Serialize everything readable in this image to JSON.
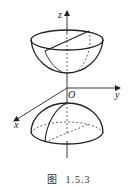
{
  "figure": {
    "axes": {
      "z_label": "z",
      "y_label": "y",
      "x_label": "x",
      "origin_label": "O"
    },
    "shapes": [
      {
        "name": "upper-bowl",
        "description": "upper half surface opening upward with a diameter line across the rim"
      },
      {
        "name": "lower-dome",
        "description": "lower half surface, dome shape, with a meridian curve and dashed hidden base edge"
      }
    ],
    "colors": {
      "stroke": "#222222",
      "background": "#ffffff"
    }
  },
  "caption": {
    "prefix": "图",
    "number": "1.5.3"
  }
}
